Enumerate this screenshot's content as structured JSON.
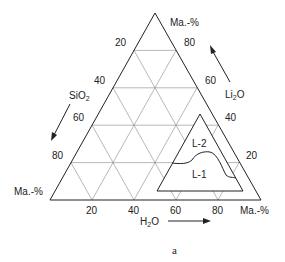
{
  "diagram": {
    "type": "ternary",
    "caption": "a",
    "unit_label": "Ma.-%",
    "components": {
      "bottom": {
        "name": "H2O",
        "ticks": [
          "20",
          "40",
          "60",
          "80"
        ]
      },
      "left": {
        "name": "SiO2",
        "ticks": [
          "20",
          "40",
          "60",
          "80"
        ]
      },
      "right": {
        "name": "Li2O",
        "ticks": [
          "20",
          "40",
          "60",
          "80"
        ]
      }
    },
    "corner_labels": {
      "top": "Ma.-%",
      "left": "Ma.-%",
      "right": "Ma.-%"
    },
    "regions": [
      {
        "label": "L-2"
      },
      {
        "label": "L-1"
      }
    ]
  }
}
